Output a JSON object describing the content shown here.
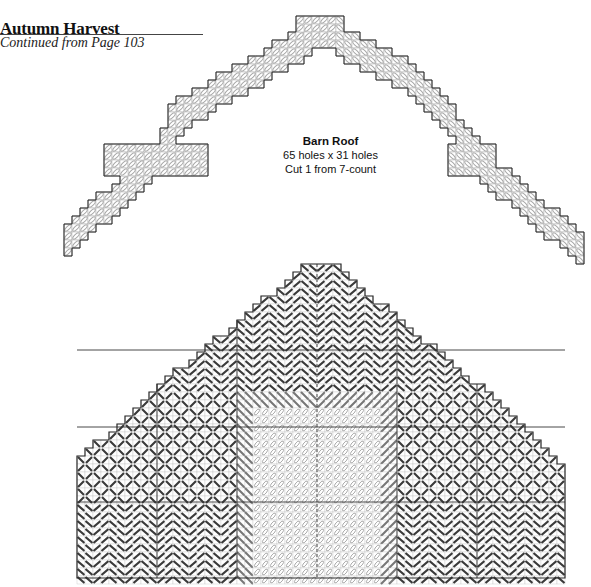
{
  "header": {
    "title": "Autumn Harvest",
    "subtitle": "Continued from Page 103"
  },
  "pieces": [
    {
      "id": "barn-roof",
      "name": "Barn Roof",
      "size": "65 holes x 31 holes",
      "cut": "Cut 1 from 7-count",
      "stitch_style": "light-slanted-ovals"
    },
    {
      "id": "barn-front",
      "name": "Barn Front",
      "stitch_styles": [
        "dark-chevron",
        "dark-diamond-lattice",
        "light-door-ovals",
        "medium-slanted-trim"
      ]
    }
  ],
  "colors": {
    "outline": "#2a2a2a",
    "grid": "#9a9a9a",
    "dark_stitch": "#3a3a3a",
    "medium_stitch": "#777777",
    "light_stitch": "#a8a8a8",
    "light_fill": "#ececec"
  }
}
